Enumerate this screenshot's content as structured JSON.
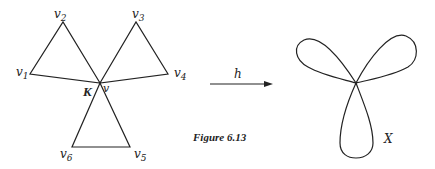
{
  "figure": {
    "caption": "Figure 6.13",
    "complex": {
      "name": "K",
      "center_vertex": "v",
      "vertices": [
        {
          "id": "v1",
          "base": "v",
          "sub": "1"
        },
        {
          "id": "v2",
          "base": "v",
          "sub": "2"
        },
        {
          "id": "v3",
          "base": "v",
          "sub": "3"
        },
        {
          "id": "v4",
          "base": "v",
          "sub": "4"
        },
        {
          "id": "v5",
          "base": "v",
          "sub": "5"
        },
        {
          "id": "v6",
          "base": "v",
          "sub": "6"
        }
      ],
      "triangles": [
        [
          "v",
          "v1",
          "v2"
        ],
        [
          "v",
          "v3",
          "v4"
        ],
        [
          "v",
          "v5",
          "v6"
        ]
      ]
    },
    "map": {
      "label": "h"
    },
    "space": {
      "name": "X",
      "description": "three-leaf clover (wedge of three circles)"
    },
    "colors": {
      "stroke": "#222222",
      "background": "#ffffff"
    }
  }
}
